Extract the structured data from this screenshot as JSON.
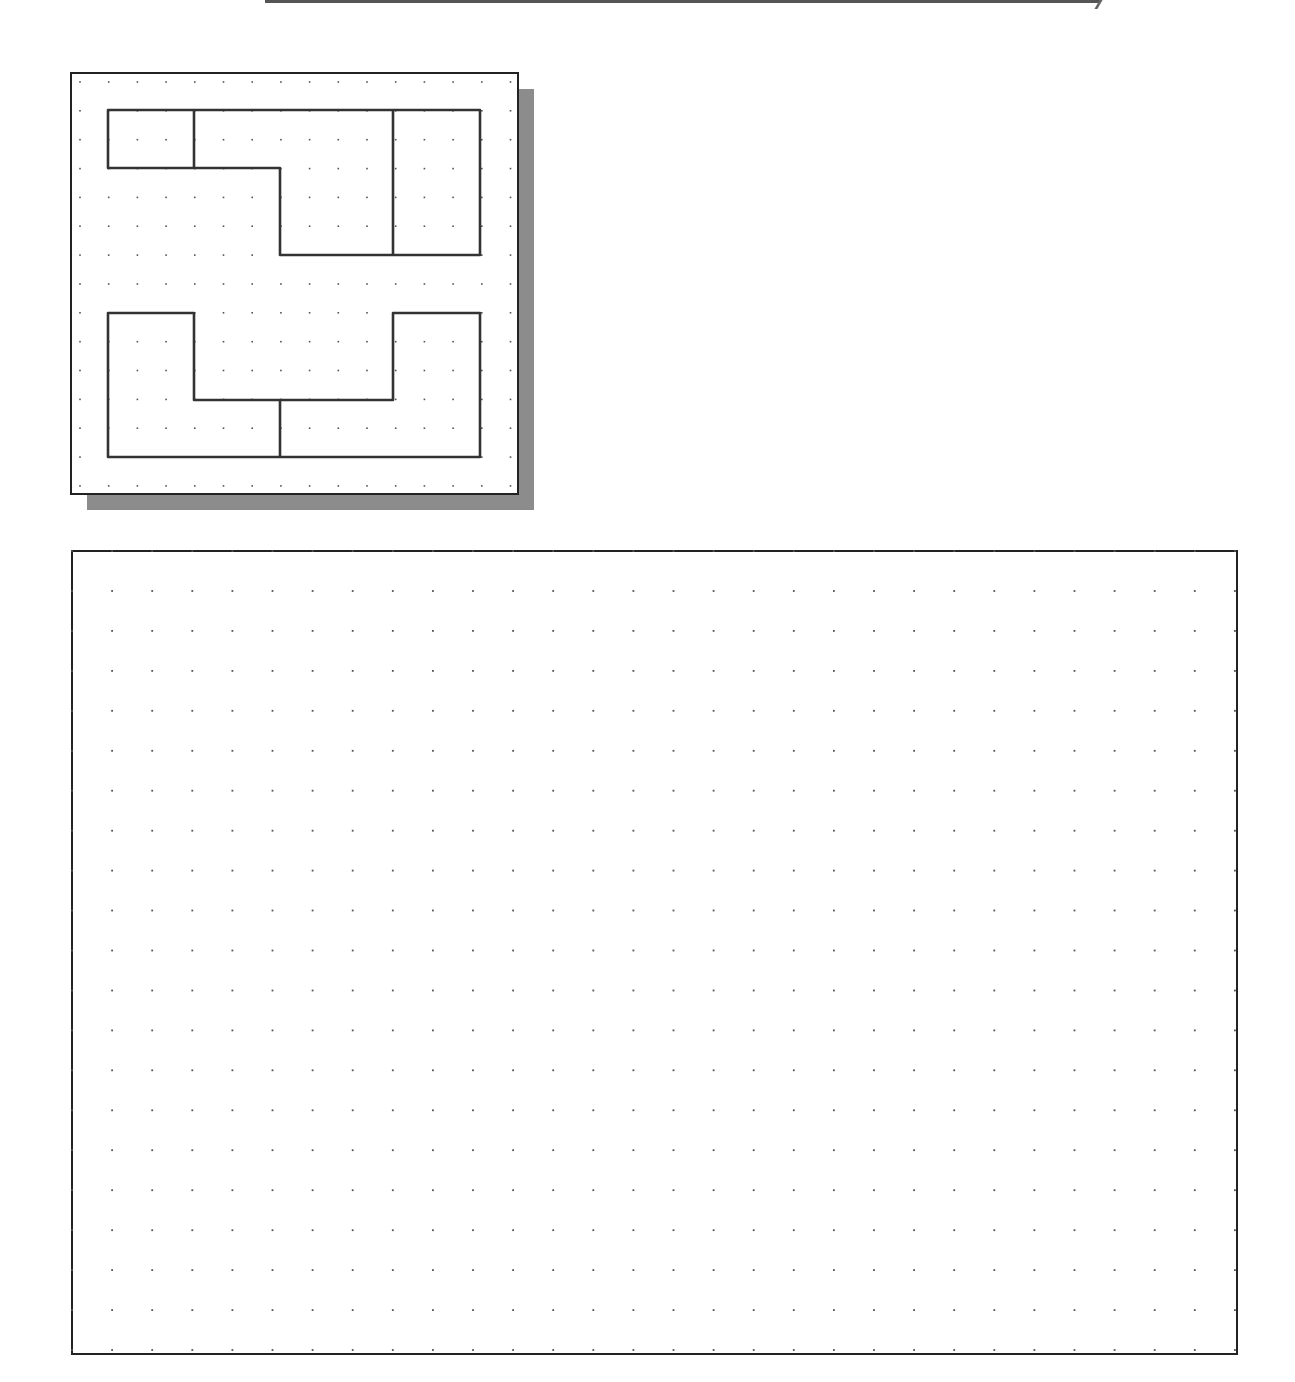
{
  "page": {
    "background": "#ffffff",
    "ink_color": "#333333",
    "dot_color": "#555555",
    "shadow_color": "#8c8c8c"
  },
  "reference_panel": {
    "label": "orthographic-views-reference",
    "box": {
      "x": 71,
      "y": 73,
      "w": 447,
      "h": 421
    },
    "shadow_offset": 16,
    "grid": {
      "origin_x": 80,
      "origin_y": 82,
      "spacing_x": 28.7,
      "spacing_y": 28.85,
      "cols": 16,
      "rows": 15
    },
    "shapes": [
      {
        "name": "top-view-outline",
        "points": [
          [
            108,
            110
          ],
          [
            480,
            110
          ],
          [
            480,
            255
          ],
          [
            280,
            255
          ],
          [
            280,
            168
          ],
          [
            108,
            168
          ]
        ]
      },
      {
        "name": "top-view-line-1",
        "points": [
          [
            194,
            110
          ],
          [
            194,
            168
          ]
        ]
      },
      {
        "name": "top-view-line-2",
        "points": [
          [
            393,
            110
          ],
          [
            393,
            255
          ]
        ]
      },
      {
        "name": "front-view-outline",
        "points": [
          [
            108,
            313
          ],
          [
            194,
            313
          ],
          [
            194,
            400
          ],
          [
            393,
            400
          ],
          [
            393,
            313
          ],
          [
            480,
            313
          ],
          [
            480,
            457
          ],
          [
            108,
            457
          ]
        ]
      },
      {
        "name": "front-view-line-1",
        "points": [
          [
            280,
            400
          ],
          [
            280,
            457
          ]
        ]
      }
    ]
  },
  "isometric_grid_panel": {
    "label": "sketch-area-dot-grid",
    "box": {
      "x": 72,
      "y": 551,
      "w": 1165,
      "h": 803
    },
    "grid": {
      "origin_x": 72,
      "origin_y": 551,
      "spacing_x": 40.1,
      "spacing_y": 39.95,
      "cols": 30,
      "rows": 21
    }
  }
}
